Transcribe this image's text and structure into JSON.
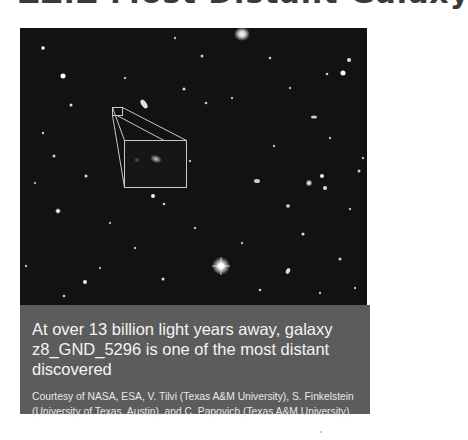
{
  "heading": {
    "text_cropped": "ZZ.Z Most Distant Galaxy"
  },
  "figure": {
    "image_alt": "Deep field starfield image with magnified inset of distant galaxy",
    "inset": {
      "small_box": {
        "x": 92,
        "y": 79,
        "w": 10,
        "h": 8
      },
      "large_box": {
        "x": 104,
        "y": 112,
        "w": 62,
        "h": 47
      },
      "box_color": "#c8c8c8"
    },
    "caption": {
      "main": "At over 13 billion light years away, galaxy z8_GND_5296 is one of the most distant discovered",
      "credit": "Courtesy of NASA, ESA, V. Tilvi (Texas A&M University), S. Finkelstein (University of Texas, Austin), and C. Papovich (Texas A&M University)"
    },
    "colors": {
      "sky": "#111111",
      "caption_bg": "#5c5c5c",
      "caption_text": "#ffffff"
    }
  }
}
